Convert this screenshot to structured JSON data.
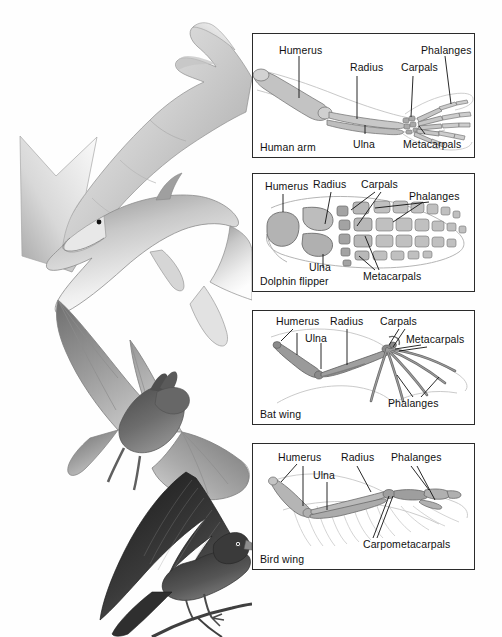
{
  "figure": {
    "background_color": "#ffffff",
    "border_color": "#2b2b2b",
    "bone_fill": "#b9b9b9",
    "bone_stroke": "#4a4a4a",
    "outline_color": "#9a9a9a"
  },
  "illustrations": [
    {
      "name": "human-arm-illustration",
      "label": "human arm and hand"
    },
    {
      "name": "dolphin-illustration",
      "label": "dolphin"
    },
    {
      "name": "bat-illustration",
      "label": "bat in flight"
    },
    {
      "name": "bird-illustration",
      "label": "bird perched on branch"
    }
  ],
  "panels": [
    {
      "id": "human-arm",
      "caption": "Human arm",
      "labels": [
        {
          "text": "Humerus",
          "x": 26,
          "y": 10
        },
        {
          "text": "Radius",
          "x": 97,
          "y": 27
        },
        {
          "text": "Carpals",
          "x": 148,
          "y": 27
        },
        {
          "text": "Phalanges",
          "x": 168,
          "y": 10
        },
        {
          "text": "Ulna",
          "x": 100,
          "y": 106
        },
        {
          "text": "Metacarpals",
          "x": 152,
          "y": 106
        }
      ]
    },
    {
      "id": "dolphin-flipper",
      "caption": "Dolphin flipper",
      "labels": [
        {
          "text": "Humerus",
          "x": 14,
          "y": 8
        },
        {
          "text": "Radius",
          "x": 62,
          "y": 6
        },
        {
          "text": "Carpals",
          "x": 110,
          "y": 6
        },
        {
          "text": "Phalanges",
          "x": 158,
          "y": 18
        },
        {
          "text": "Ulna",
          "x": 58,
          "y": 88
        },
        {
          "text": "Metacarpals",
          "x": 112,
          "y": 96
        }
      ]
    },
    {
      "id": "bat-wing",
      "caption": "Bat wing",
      "labels": [
        {
          "text": "Humerus",
          "x": 25,
          "y": 6
        },
        {
          "text": "Radius",
          "x": 79,
          "y": 6
        },
        {
          "text": "Carpals",
          "x": 129,
          "y": 6
        },
        {
          "text": "Ulna",
          "x": 54,
          "y": 23
        },
        {
          "text": "Metacarpals",
          "x": 155,
          "y": 24
        },
        {
          "text": "Phalanges",
          "x": 137,
          "y": 89
        }
      ]
    },
    {
      "id": "bird-wing",
      "caption": "Bird wing",
      "labels": [
        {
          "text": "Humerus",
          "x": 27,
          "y": 9
        },
        {
          "text": "Radius",
          "x": 90,
          "y": 9
        },
        {
          "text": "Phalanges",
          "x": 140,
          "y": 9
        },
        {
          "text": "Ulna",
          "x": 62,
          "y": 27
        },
        {
          "text": "Carpometacarpals",
          "x": 112,
          "y": 98
        }
      ]
    }
  ]
}
